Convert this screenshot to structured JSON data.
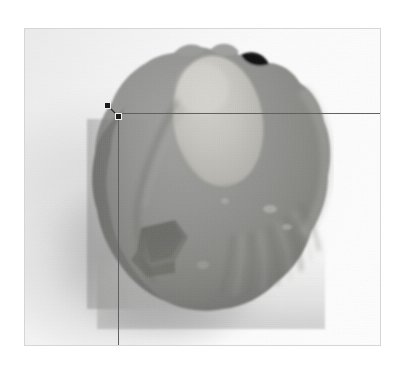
{
  "app": {
    "view_name": "Image Measurement View",
    "background_color": "#ffffff"
  },
  "photo_frame": {
    "name": "scanned photograph",
    "border_color": "#d6d6d6",
    "background_color": "#fcfcfc",
    "left": 24,
    "top": 28,
    "width": 357,
    "height": 318
  },
  "subject": {
    "description": "grayscale photograph of a stone artifact / lithic core",
    "body_color": "#8e8e8e",
    "highlight_color": "#c9c8c3",
    "shadow_color": "#6a6a6a",
    "backdrop_shadow_color": "#b4b4b4"
  },
  "overlay": {
    "guides": [
      {
        "name": "horizontal-guide",
        "orientation": "horizontal",
        "color": "#606060",
        "x": 118,
        "y": 113,
        "length": 263
      },
      {
        "name": "vertical-guide",
        "orientation": "vertical",
        "color": "#606060",
        "x": 118,
        "y": 113,
        "length": 232
      }
    ],
    "handles": [
      {
        "name": "origin-handle",
        "x": 107,
        "y": 105,
        "color": "#1a1a1a",
        "size": 7
      },
      {
        "name": "point-handle",
        "x": 118,
        "y": 116,
        "color": "#1a1a1a",
        "size": 7
      }
    ]
  }
}
